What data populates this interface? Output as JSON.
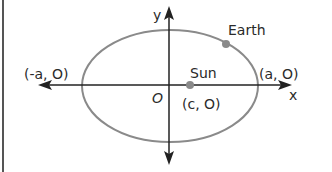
{
  "diagram": {
    "axes": {
      "x_label": "x",
      "y_label": "y",
      "origin_label": "O"
    },
    "points": {
      "left_vertex": "(-a, O)",
      "right_vertex": "(a, O)",
      "sun_label": "Sun",
      "sun_coords": "(c, O)",
      "earth_label": "Earth"
    },
    "colors": {
      "ellipse": "#8a8a8a",
      "axes": "#222222",
      "points": "#8a8a8a",
      "text": "#2a2a2a",
      "border": "#555555"
    }
  }
}
